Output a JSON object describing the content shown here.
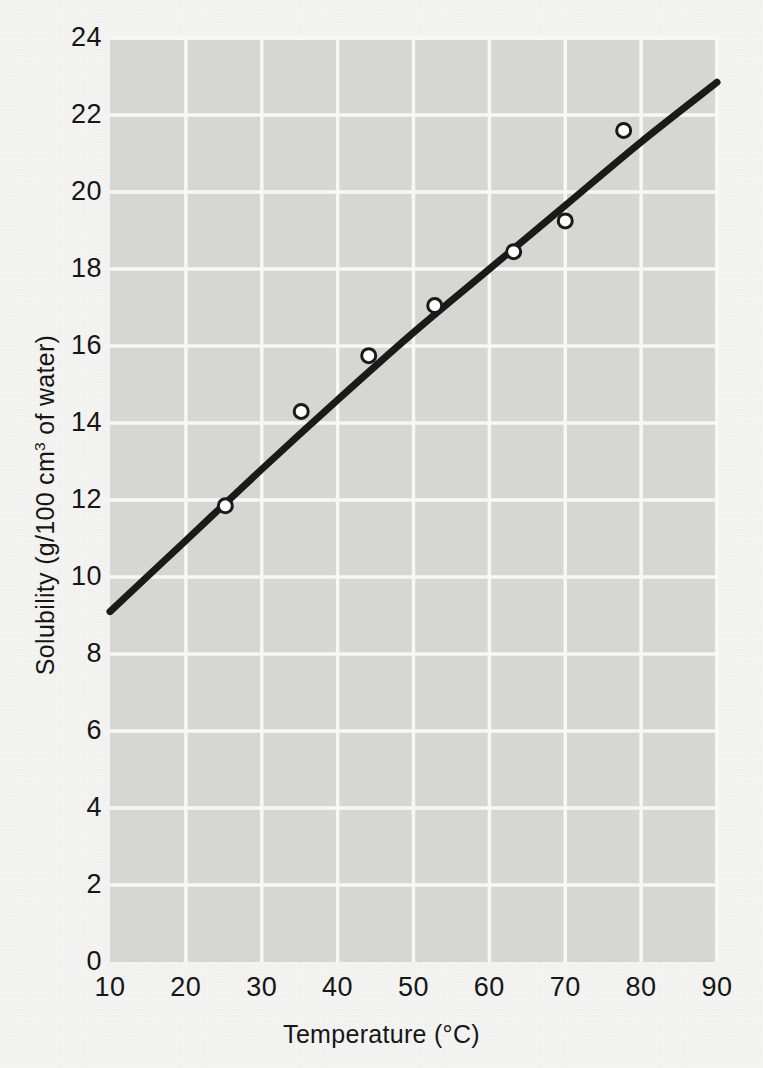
{
  "figure": {
    "background_color": "#f3f3f1",
    "plot_background_color": "#d6d6d4",
    "gridline_color": "#f7f7f5",
    "curve_color": "#1a1a1a",
    "marker_facecolor": "#ffffff",
    "marker_edgecolor": "#1a1a1a"
  },
  "axes": {
    "x": {
      "title_prefix": "Temperature (",
      "title_unit": "°C",
      "title_suffix": ")",
      "title_full": "Temperature (°C)",
      "ticks": [
        "10",
        "20",
        "30",
        "40",
        "50",
        "60",
        "70",
        "80",
        "90"
      ]
    },
    "y": {
      "title_prefix": "Solubility (g/100 cm",
      "title_sup": "3",
      "title_suffix": " of water)",
      "title_full": "Solubility (g/100 cm3 of water)",
      "ticks": [
        "0",
        "2",
        "4",
        "6",
        "8",
        "10",
        "12",
        "14",
        "16",
        "18",
        "20",
        "22",
        "24"
      ]
    }
  },
  "chart_data": {
    "type": "scatter",
    "title": "",
    "xlabel": "Temperature (°C)",
    "ylabel": "Solubility (g/100 cm3 of water)",
    "xlim": [
      10,
      90
    ],
    "ylim": [
      0,
      24
    ],
    "xticks": [
      10,
      20,
      30,
      40,
      50,
      60,
      70,
      80,
      90
    ],
    "yticks": [
      0,
      2,
      4,
      6,
      8,
      10,
      12,
      14,
      16,
      18,
      20,
      22,
      24
    ],
    "grid": true,
    "legend": "none",
    "series": [
      {
        "name": "Measured solubility",
        "type": "scatter",
        "marker": "open-circle",
        "x": [
          25.2,
          35.2,
          44.1,
          52.8,
          63.2,
          70.0,
          77.7
        ],
        "y": [
          11.85,
          14.3,
          15.75,
          17.05,
          18.45,
          19.25,
          21.6
        ]
      },
      {
        "name": "Best-fit curve",
        "type": "line",
        "x": [
          10,
          20,
          30,
          40,
          50,
          60,
          70,
          80,
          90
        ],
        "y": [
          9.1,
          10.95,
          12.8,
          14.6,
          16.35,
          18.0,
          19.65,
          21.3,
          22.85
        ]
      }
    ]
  }
}
